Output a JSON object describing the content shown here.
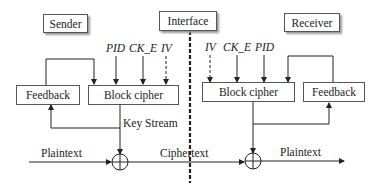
{
  "titles": {
    "sender": "Sender",
    "interface": "Interface",
    "receiver": "Receiver"
  },
  "sender": {
    "feedback": "Feedback",
    "block_cipher": "Block cipher",
    "inputs": [
      "PID",
      "CK_E",
      "IV"
    ],
    "key_stream": "Key Stream",
    "plaintext": "Plaintext"
  },
  "channel": {
    "ciphertext": "Ciphertext"
  },
  "receiver": {
    "block_cipher": "Block cipher",
    "feedback": "Feedback",
    "inputs": [
      "IV",
      "CK_E",
      "PID"
    ],
    "plaintext": "Plaintext"
  }
}
